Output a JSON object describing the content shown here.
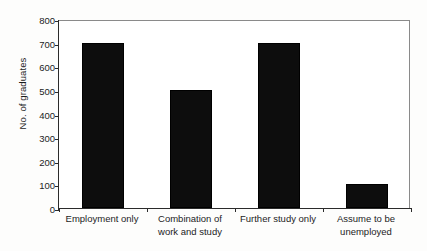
{
  "chart_data": {
    "type": "bar",
    "title": "",
    "xlabel": "",
    "ylabel": "No. of graduates",
    "categories": [
      "Employment only",
      "Combination of work and study",
      "Further study only",
      "Assume to be unemployed"
    ],
    "category_lines": [
      [
        "Employment only"
      ],
      [
        "Combination of",
        "work and study"
      ],
      [
        "Further study only"
      ],
      [
        "Assume to be",
        "unemployed"
      ]
    ],
    "values": [
      700,
      500,
      700,
      100
    ],
    "ylim": [
      0,
      800
    ],
    "ytick_step": 100,
    "yticks": [
      800,
      700,
      600,
      500,
      400,
      300,
      200,
      100,
      0
    ],
    "ytick_labels": [
      "800",
      "700",
      "600",
      "500",
      "400",
      "300",
      "200",
      "100",
      "0"
    ],
    "grid": false,
    "legend": false,
    "legend_position": "none",
    "bar_color": "#0d0d0d",
    "axis_color": "#2b2b2b",
    "frame_color": "#8a8a8a",
    "background_color": "#ffffff"
  }
}
